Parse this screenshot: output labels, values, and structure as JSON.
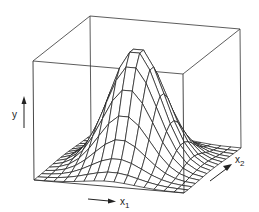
{
  "chart_data": {
    "type": "surface",
    "title": "",
    "axes": {
      "y": {
        "label": "y",
        "direction": "up"
      },
      "x1": {
        "label": "x",
        "subscript": "1",
        "direction": "right"
      },
      "x2": {
        "label": "x",
        "subscript": "2",
        "direction": "depth"
      }
    },
    "grid": {
      "n_x1": 15,
      "n_x2": 15
    },
    "surface": {
      "function": "gaussian",
      "center": [
        0.5,
        0.5
      ],
      "sigma_x1": 0.17,
      "sigma_x2": 0.2,
      "peak": 0.98
    },
    "ticks": false,
    "legend": false
  },
  "colors": {
    "line": "#1a1a1a",
    "box": "#333333",
    "background": "#ffffff"
  },
  "projection": {
    "origin": [
      34,
      180
    ],
    "x1_vec": [
      150,
      13
    ],
    "x2_vec": [
      57,
      -45
    ],
    "y_vec": [
      -1,
      -119
    ]
  },
  "labels": {
    "y": "y",
    "x1": "x",
    "x1_sub": "1",
    "x2": "x",
    "x2_sub": "2"
  }
}
